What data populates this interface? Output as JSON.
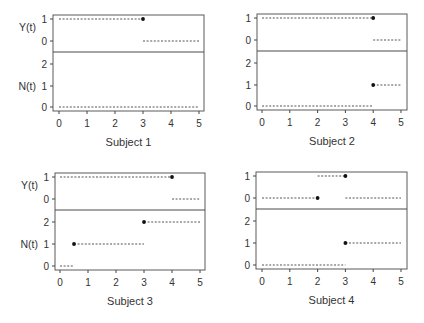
{
  "chart_data": [
    {
      "type": "line",
      "title": "Subject 1",
      "xlabel": "Subject 1",
      "xlim": [
        0,
        5
      ],
      "x_ticks": [
        "0",
        "1",
        "2",
        "3",
        "4",
        "5"
      ],
      "upper_panel": {
        "ylabel": "Y(t)",
        "y_ticks": [
          "1",
          "0"
        ],
        "segments": [
          {
            "y": 1,
            "x0": 0,
            "x1": 3
          },
          {
            "y": 0,
            "x0": 3,
            "x1": 5
          }
        ],
        "points": [
          {
            "x": 3,
            "y": 1
          }
        ]
      },
      "lower_panel": {
        "ylabel": "N(t)",
        "y_ticks": [
          "2",
          "1",
          "0"
        ],
        "segments": [
          {
            "y": 0,
            "x0": 0,
            "x1": 5
          }
        ],
        "points": []
      }
    },
    {
      "type": "line",
      "title": "Subject 2",
      "xlabel": "Subject 2",
      "xlim": [
        0,
        5
      ],
      "x_ticks": [
        "0",
        "1",
        "2",
        "3",
        "4",
        "5"
      ],
      "upper_panel": {
        "ylabel": "",
        "y_ticks": [
          "1",
          "0"
        ],
        "segments": [
          {
            "y": 1,
            "x0": 0,
            "x1": 4
          },
          {
            "y": 0,
            "x0": 4,
            "x1": 5
          }
        ],
        "points": [
          {
            "x": 4,
            "y": 1
          }
        ]
      },
      "lower_panel": {
        "ylabel": "",
        "y_ticks": [
          "2",
          "1",
          "0"
        ],
        "segments": [
          {
            "y": 0,
            "x0": 0,
            "x1": 4
          },
          {
            "y": 1,
            "x0": 4,
            "x1": 5
          }
        ],
        "points": [
          {
            "x": 4,
            "y": 1
          }
        ]
      }
    },
    {
      "type": "line",
      "title": "Subject 3",
      "xlabel": "Subject 3",
      "xlim": [
        0,
        5
      ],
      "x_ticks": [
        "0",
        "1",
        "2",
        "3",
        "4",
        "5"
      ],
      "upper_panel": {
        "ylabel": "Y(t)",
        "y_ticks": [
          "1",
          "0"
        ],
        "segments": [
          {
            "y": 1,
            "x0": 0,
            "x1": 4
          },
          {
            "y": 0,
            "x0": 4,
            "x1": 5
          }
        ],
        "points": [
          {
            "x": 4,
            "y": 1
          }
        ]
      },
      "lower_panel": {
        "ylabel": "N(t)",
        "y_ticks": [
          "2",
          "1",
          "0"
        ],
        "segments": [
          {
            "y": 0,
            "x0": 0,
            "x1": 0.5
          },
          {
            "y": 1,
            "x0": 0.5,
            "x1": 3
          },
          {
            "y": 2,
            "x0": 3,
            "x1": 5
          }
        ],
        "points": [
          {
            "x": 0.5,
            "y": 1
          },
          {
            "x": 3,
            "y": 2
          }
        ]
      }
    },
    {
      "type": "line",
      "title": "Subject 4",
      "xlabel": "Subject 4",
      "xlim": [
        0,
        5
      ],
      "x_ticks": [
        "0",
        "1",
        "2",
        "3",
        "4",
        "5"
      ],
      "upper_panel": {
        "ylabel": "",
        "y_ticks": [
          "1",
          "0"
        ],
        "segments": [
          {
            "y": 0,
            "x0": 0,
            "x1": 2
          },
          {
            "y": 1,
            "x0": 2,
            "x1": 3
          },
          {
            "y": 0,
            "x0": 3,
            "x1": 5
          }
        ],
        "points": [
          {
            "x": 2,
            "y": 0
          },
          {
            "x": 3,
            "y": 1
          }
        ]
      },
      "lower_panel": {
        "ylabel": "",
        "y_ticks": [
          "2",
          "1",
          "0"
        ],
        "segments": [
          {
            "y": 0,
            "x0": 0,
            "x1": 3
          },
          {
            "y": 1,
            "x0": 3,
            "x1": 5
          }
        ],
        "points": [
          {
            "x": 3,
            "y": 1
          }
        ]
      }
    }
  ],
  "layout": {
    "panels": [
      {
        "left": 53,
        "right": 204,
        "top": 15,
        "divider": 52,
        "bottom": 111,
        "x0": 59,
        "xscale": 28,
        "yU1": 19,
        "yU0": 41,
        "yN2": 64,
        "yN1": 86,
        "yN0": 107,
        "title_y": 146,
        "tick_label_y": 127
      },
      {
        "left": 257,
        "right": 407,
        "top": 14,
        "divider": 51,
        "bottom": 110,
        "x0": 262,
        "xscale": 27.8,
        "yU1": 18,
        "yU0": 40,
        "yN2": 63,
        "yN1": 85,
        "yN0": 106,
        "title_y": 145,
        "tick_label_y": 126
      },
      {
        "left": 55,
        "right": 205,
        "top": 173,
        "divider": 210,
        "bottom": 270,
        "x0": 60,
        "xscale": 28,
        "yU1": 177,
        "yU0": 199,
        "yN2": 222,
        "yN1": 244,
        "yN0": 266,
        "title_y": 305,
        "tick_label_y": 286
      },
      {
        "left": 256,
        "right": 407,
        "top": 172,
        "divider": 209,
        "bottom": 269,
        "x0": 262,
        "xscale": 27.8,
        "yU1": 176,
        "yU0": 198,
        "yN2": 221,
        "yN1": 243,
        "yN0": 265,
        "title_y": 304,
        "tick_label_y": 285
      }
    ]
  }
}
